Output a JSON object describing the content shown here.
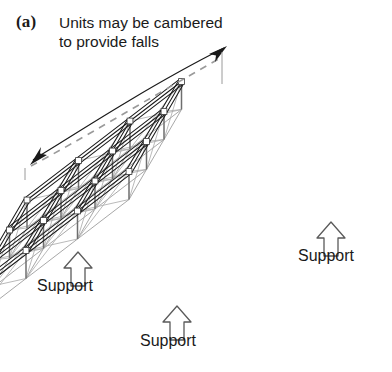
{
  "figure": {
    "panel_label": "(a)",
    "caption": "Units may be cambered\nto provide falls",
    "grid": {
      "bays_u": 3,
      "bays_v": 3
    }
  },
  "annotations": {
    "camber_arrow": {
      "name": "camber-direction-arrow",
      "style": "double-headed curved arc",
      "color": "#1a1a1a"
    },
    "camber_dashed_line": {
      "name": "camber-reference-line",
      "style": "dashed",
      "color": "#9a9a9a"
    },
    "supports": [
      {
        "id": "left",
        "label": "Support"
      },
      {
        "id": "mid",
        "label": "Support"
      },
      {
        "id": "right",
        "label": "Support"
      }
    ]
  },
  "colors": {
    "line_dark": "#1a1a1a",
    "line_mid": "#6e6e6e",
    "line_light": "#a8a8a8",
    "dashed": "#9a9a9a",
    "background": "#ffffff"
  }
}
